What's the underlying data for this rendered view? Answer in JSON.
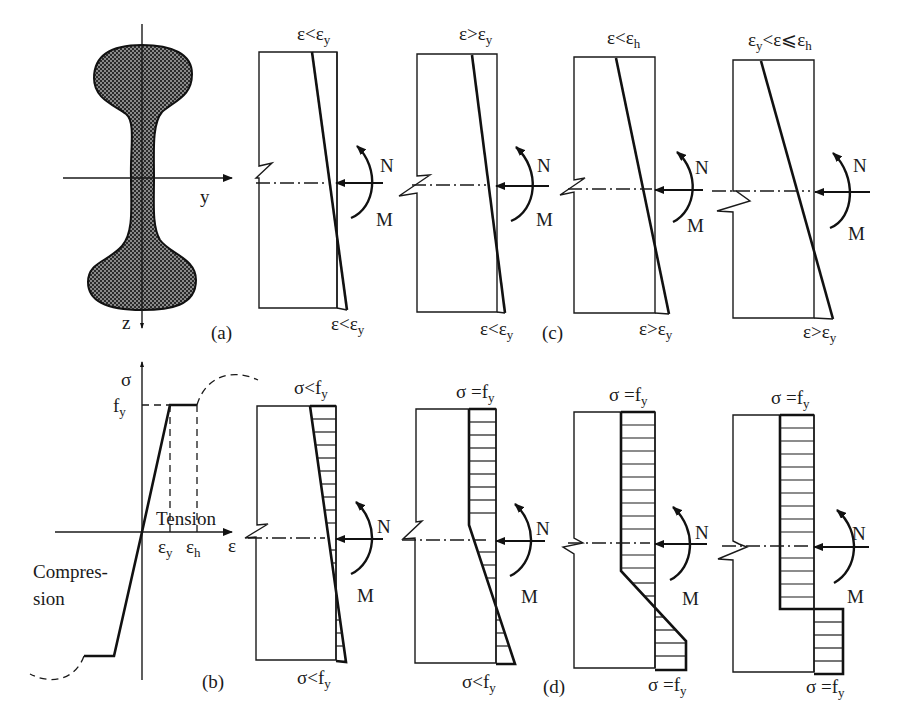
{
  "figure": {
    "panel_labels": {
      "a": "(a)",
      "b": "(b)",
      "c": "(c)",
      "d": "(d)"
    },
    "cross_section": {
      "axis_y": "y",
      "axis_z": "z"
    },
    "stress_strain": {
      "axis_sigma": "σ",
      "axis_epsilon": "ε",
      "fy": {
        "main": "f",
        "sub": "y"
      },
      "eps_y": {
        "main": "ε",
        "sub": "y"
      },
      "eps_h": {
        "main": "ε",
        "sub": "h"
      },
      "tension": "Tension",
      "compression_line1": "Compres-",
      "compression_line2": "sion"
    },
    "loads": {
      "axial": "N",
      "moment": "M"
    },
    "strain_panels": [
      {
        "top": {
          "main": "ε<ε",
          "sub": "y"
        },
        "bottom": {
          "main": "ε<ε",
          "sub": "y"
        }
      },
      {
        "top": {
          "main": "ε>ε",
          "sub": "y"
        },
        "bottom": {
          "main": "ε<ε",
          "sub": "y"
        }
      },
      {
        "top": {
          "main": "ε<ε",
          "sub": "h"
        },
        "bottom": {
          "main": "ε>ε",
          "sub": "y"
        }
      },
      {
        "top": {
          "pre": "ε",
          "pre_sub": "y",
          "main": "<ε⩽ε",
          "sub": "h"
        },
        "bottom": {
          "main": "ε>ε",
          "sub": "y"
        }
      }
    ],
    "stress_panels": [
      {
        "top": {
          "main": "σ<f",
          "sub": "y"
        },
        "bottom": {
          "main": "σ<f",
          "sub": "y"
        }
      },
      {
        "top": {
          "main": "σ =f",
          "sub": "y"
        },
        "bottom": {
          "main": "σ<f",
          "sub": "y"
        }
      },
      {
        "top": {
          "main": "σ =f",
          "sub": "y"
        },
        "bottom": {
          "main": "σ =f",
          "sub": "y"
        }
      },
      {
        "top": {
          "main": "σ =f",
          "sub": "y"
        },
        "bottom": {
          "main": "σ =f",
          "sub": "y"
        }
      }
    ]
  }
}
